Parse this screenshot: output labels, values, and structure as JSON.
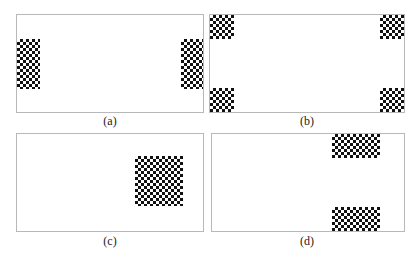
{
  "figure": {
    "panels": [
      {
        "id": "a",
        "caption": "(a)",
        "description": "Checkerboard patterns at left and right edges"
      },
      {
        "id": "b",
        "caption": "(b)",
        "description": "Checkerboard patterns at four corners"
      },
      {
        "id": "c",
        "caption": "(c)",
        "description": "Single checkerboard pattern right of center"
      },
      {
        "id": "d",
        "caption": "(d)",
        "description": "Checkerboard patterns at top and bottom edges, right side"
      }
    ]
  }
}
